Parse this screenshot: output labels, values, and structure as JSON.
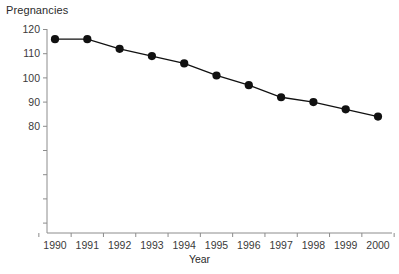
{
  "chart_data": {
    "type": "line",
    "title": "Pregnancies",
    "subtitle": "",
    "xlabel": "Year",
    "ylabel": "Pregnancies",
    "categories": [
      1990,
      1991,
      1992,
      1993,
      1994,
      1995,
      1996,
      1997,
      1998,
      1999,
      2000
    ],
    "x": [
      1990,
      1991,
      1992,
      1993,
      1994,
      1995,
      1996,
      1997,
      1998,
      1999,
      2000
    ],
    "values": [
      116,
      116,
      112,
      109,
      106,
      101,
      97,
      92,
      90,
      87,
      84
    ],
    "series": [
      {
        "name": "Pregnancies",
        "values": [
          116,
          116,
          112,
          109,
          106,
          101,
          97,
          92,
          90,
          87,
          84
        ]
      }
    ],
    "xlim": [
      1989.6,
      2000.4
    ],
    "ylim": [
      40,
      120
    ],
    "xtick_labels": [
      "1990",
      "1991",
      "1992",
      "1993",
      "1994",
      "1995",
      "1996",
      "1997",
      "1998",
      "1999",
      "2000"
    ],
    "ytick_labels": [
      "80",
      "90",
      "100",
      "110",
      "120"
    ],
    "ytick_values": [
      80,
      90,
      100,
      110,
      120
    ],
    "yminor_tick_values": [
      40,
      50,
      60,
      70
    ],
    "grid": false,
    "legend": false,
    "legend_position": "none",
    "marker": "filled-circle",
    "marker_color": "#111111",
    "line_color": "#111111",
    "axis_color": "#8c8c8c",
    "text_color": "#2b2b2b"
  }
}
